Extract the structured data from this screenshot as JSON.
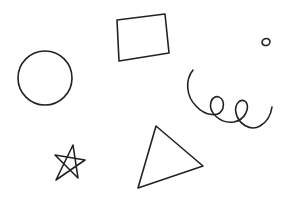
{
  "canvas": {
    "width": 288,
    "height": 202,
    "background": "#ffffff",
    "stroke_color": "#222222"
  },
  "shapes": [
    {
      "name": "circle",
      "type": "circle",
      "cx": 45,
      "cy": 78,
      "r": 27
    },
    {
      "name": "rectangle",
      "type": "quadrilateral",
      "points": [
        [
          117,
          20
        ],
        [
          165,
          14
        ],
        [
          169,
          53
        ],
        [
          119,
          61
        ]
      ]
    },
    {
      "name": "small-circle",
      "type": "ellipse",
      "cx": 266,
      "cy": 42,
      "rx": 4,
      "ry": 3.5
    },
    {
      "name": "spiral",
      "type": "spiral"
    },
    {
      "name": "star",
      "type": "star",
      "points": [
        [
          73,
          145
        ],
        [
          55,
          155
        ],
        [
          85,
          160
        ],
        [
          56,
          180
        ],
        [
          78,
          178
        ]
      ]
    },
    {
      "name": "triangle",
      "type": "triangle",
      "points": [
        [
          156,
          126
        ],
        [
          203,
          166
        ],
        [
          138,
          188
        ]
      ]
    }
  ]
}
